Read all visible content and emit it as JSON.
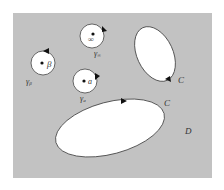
{
  "diagram": {
    "background": "#ffffff",
    "region_color": "#c2c2c2",
    "hole_color": "#ffffff",
    "stroke_color": "#444444",
    "region": {
      "x": 13,
      "y": 13,
      "w": 199,
      "h": 165,
      "label": "D",
      "label_x": 185,
      "label_y": 133
    },
    "small_circles": [
      {
        "name": "gamma-infinity",
        "cx": 92,
        "cy": 35,
        "r": 12,
        "point_label": "∞",
        "contour_label": "γ",
        "contour_sub": "∞",
        "label_x": 94,
        "label_y": 56
      },
      {
        "name": "gamma-beta",
        "cx": 43,
        "cy": 63,
        "r": 12,
        "point_label": "β",
        "contour_label": "γ",
        "contour_sub": "β",
        "label_x": 26,
        "label_y": 84
      },
      {
        "name": "gamma-a",
        "cx": 85,
        "cy": 81,
        "r": 12,
        "point_label": "a",
        "contour_label": "γ",
        "contour_sub": "a",
        "label_x": 80,
        "label_y": 101
      }
    ],
    "ellipses": [
      {
        "name": "upper-hole",
        "cx": 155,
        "cy": 54,
        "rx": 19,
        "ry": 28,
        "rotate": -25,
        "label": "C",
        "label_x": 178,
        "label_y": 83
      },
      {
        "name": "lower-hole",
        "cx": 110,
        "cy": 128,
        "rx": 56,
        "ry": 26,
        "rotate": -15,
        "label": "C",
        "label_x": 165,
        "label_y": 106
      }
    ]
  }
}
